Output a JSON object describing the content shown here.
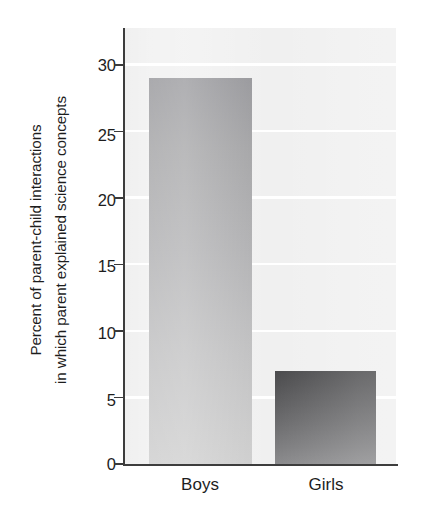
{
  "chart_data": {
    "type": "bar",
    "title": "",
    "subtitle": "",
    "xlabel": "",
    "ylabel": "Percent of parent-child interactions in which parent explained science concepts",
    "ylabel_lines": [
      "Percent of parent-child interactions",
      "in which parent explained science concepts"
    ],
    "categories": [
      "Boys",
      "Girls"
    ],
    "values": [
      29,
      7
    ],
    "series": [
      {
        "name": "Percent of interactions with science explanation",
        "values": [
          29,
          7
        ]
      }
    ],
    "ylim": [
      0,
      31
    ],
    "yticks": [
      0,
      5,
      10,
      15,
      20,
      25,
      30
    ],
    "ytick_labels": [
      "0",
      "5",
      "10",
      "15",
      "20",
      "25",
      "30"
    ],
    "grid": "horizontal-white-gridlines",
    "legend": "none",
    "legend_position": "none",
    "bar_colors": [
      "#b0b0b2",
      "#5f5f61"
    ],
    "plot_background": "#f0f0f0",
    "gridline_color": "#ffffff",
    "axis_color": "#3d3d3d",
    "text_color": "#1d1d1d"
  },
  "axis": {
    "ticks": [
      {
        "label": "30",
        "value": 30
      },
      {
        "label": "25",
        "value": 25
      },
      {
        "label": "20",
        "value": 20
      },
      {
        "label": "15",
        "value": 15
      },
      {
        "label": "10",
        "value": 10
      },
      {
        "label": "5",
        "value": 5
      },
      {
        "label": "0",
        "value": 0
      }
    ]
  }
}
